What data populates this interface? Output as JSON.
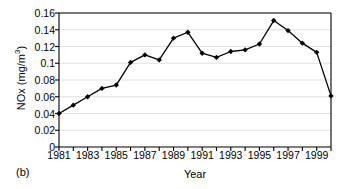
{
  "figure": {
    "panel_caption": "(b)",
    "xlabel": "Year",
    "ylabel_text": "NOx (mg/m",
    "ylabel_unit_exponent": "3",
    "ylabel_close": ")"
  },
  "chart_data": {
    "type": "line",
    "title": "",
    "xlabel": "Year",
    "ylabel": "NOx (mg/m3)",
    "xlim": [
      1981,
      2000
    ],
    "ylim": [
      0,
      0.16
    ],
    "grid": true,
    "legend": "none",
    "marker": "filled-diamond",
    "line_color": "#000000",
    "marker_color": "#000000",
    "gridline_color": "#d9d9d9",
    "axis_color": "#000000",
    "x_tick_labels": [
      "1981",
      "1983",
      "1985",
      "1987",
      "1989",
      "1991",
      "1993",
      "1995",
      "1997",
      "1999"
    ],
    "x_tick_values": [
      1981,
      1983,
      1985,
      1987,
      1989,
      1991,
      1993,
      1995,
      1997,
      1999
    ],
    "x_minor_ticks": [
      1982,
      1984,
      1986,
      1988,
      1990,
      1992,
      1994,
      1996,
      1998,
      2000
    ],
    "y_tick_labels": [
      "0",
      "0.02",
      "0.04",
      "0.06",
      "0.08",
      "0.1",
      "0.12",
      "0.14",
      "0.16"
    ],
    "y_tick_values": [
      0,
      0.02,
      0.04,
      0.06,
      0.08,
      0.1,
      0.12,
      0.14,
      0.16
    ],
    "x": [
      1981,
      1982,
      1983,
      1984,
      1985,
      1986,
      1987,
      1988,
      1989,
      1990,
      1991,
      1992,
      1993,
      1994,
      1995,
      1996,
      1997,
      1998,
      1999,
      2000
    ],
    "values": [
      0.04,
      0.05,
      0.06,
      0.07,
      0.074,
      0.101,
      0.11,
      0.104,
      0.13,
      0.137,
      0.112,
      0.107,
      0.114,
      0.116,
      0.123,
      0.151,
      0.139,
      0.124,
      0.113,
      0.061
    ]
  }
}
